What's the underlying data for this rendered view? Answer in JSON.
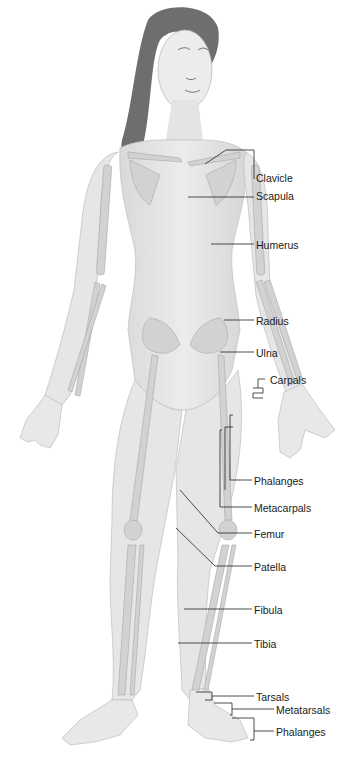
{
  "figure": {
    "colors": {
      "skin": "#e6e6e6",
      "bone": "#d4d4d4",
      "hair": "#6e6e6e",
      "line": "#222222",
      "text": "#1a1a1a"
    }
  },
  "labels": [
    {
      "id": "clavicle",
      "text": "Clavicle",
      "x": 256,
      "y": 172
    },
    {
      "id": "scapula",
      "text": "Scapula",
      "x": 256,
      "y": 190
    },
    {
      "id": "humerus",
      "text": "Humerus",
      "x": 256,
      "y": 239
    },
    {
      "id": "radius",
      "text": "Radius",
      "x": 256,
      "y": 315
    },
    {
      "id": "ulna",
      "text": "Ulna",
      "x": 256,
      "y": 347
    },
    {
      "id": "carpals",
      "text": "Carpals",
      "x": 270,
      "y": 374
    },
    {
      "id": "phalanges-hand",
      "text": "Phalanges",
      "x": 254,
      "y": 475
    },
    {
      "id": "metacarpals",
      "text": "Metacarpals",
      "x": 254,
      "y": 502
    },
    {
      "id": "femur",
      "text": "Femur",
      "x": 254,
      "y": 529
    },
    {
      "id": "patella",
      "text": "Patella",
      "x": 254,
      "y": 562
    },
    {
      "id": "fibula",
      "text": "Fibula",
      "x": 254,
      "y": 604
    },
    {
      "id": "tibia",
      "text": "Tibia",
      "x": 254,
      "y": 637
    },
    {
      "id": "tarsals",
      "text": "Tarsals",
      "x": 256,
      "y": 691
    },
    {
      "id": "metatarsals",
      "text": "Metatarsals",
      "x": 276,
      "y": 705
    },
    {
      "id": "phalanges-foot",
      "text": "Phalanges",
      "x": 276,
      "y": 727
    }
  ]
}
